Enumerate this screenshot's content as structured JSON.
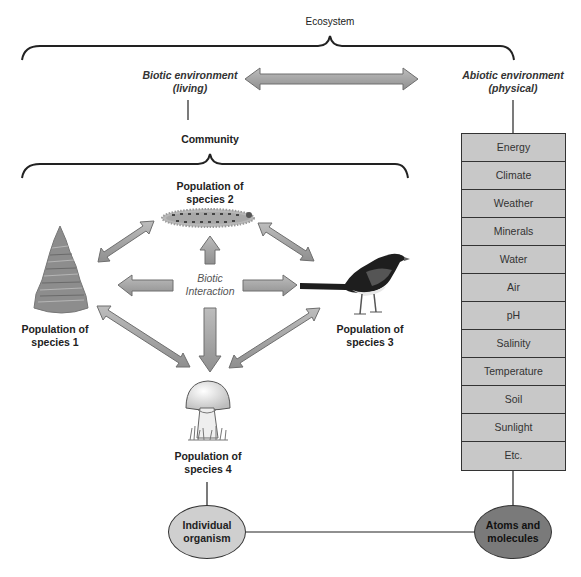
{
  "ecosystem": {
    "title": "Ecosystem",
    "biotic": {
      "line1": "Biotic environment",
      "line2": "(living)"
    },
    "abiotic": {
      "line1": "Abiotic environment",
      "line2": "(physical)"
    }
  },
  "community": {
    "title": "Community",
    "center_label": {
      "line1": "Biotic",
      "line2": "Interaction"
    },
    "populations": [
      {
        "id": "species-1",
        "line1": "Population of",
        "line2": "species 1",
        "icon": "tree-icon"
      },
      {
        "id": "species-2",
        "line1": "Population of",
        "line2": "species 2",
        "icon": "caterpillar-icon"
      },
      {
        "id": "species-3",
        "line1": "Population of",
        "line2": "species 3",
        "icon": "bird-icon"
      },
      {
        "id": "species-4",
        "line1": "Population of",
        "line2": "species 4",
        "icon": "mushroom-icon"
      }
    ]
  },
  "abiotic_factors": [
    "Energy",
    "Climate",
    "Weather",
    "Minerals",
    "Water",
    "Air",
    "pH",
    "Salinity",
    "Temperature",
    "Soil",
    "Sunlight",
    "Etc."
  ],
  "bottom": {
    "individual": {
      "line1": "Individual",
      "line2": "organism"
    },
    "atoms": {
      "line1": "Atoms and",
      "line2": "molecules"
    }
  },
  "colors": {
    "arrow_fill": "#a8a8a8",
    "arrow_stroke": "#6e6e6e",
    "box_fill": "#c8c8c8",
    "oval_light": "#cfcfcf",
    "oval_dark": "#7a7a7a",
    "line": "#333333"
  }
}
